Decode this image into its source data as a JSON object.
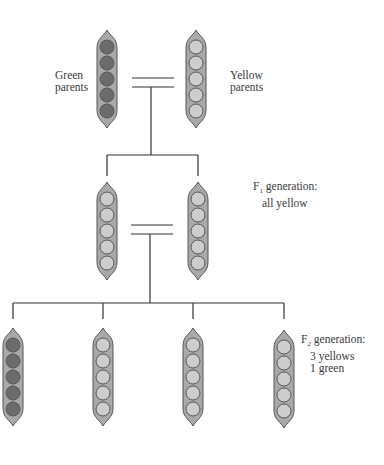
{
  "colors": {
    "pod_fill": "#a9a9a9",
    "pod_stroke": "#555555",
    "green_pea": "#6b6b6b",
    "yellow_pea": "#cdcdcd",
    "line": "#333333"
  },
  "generations": [
    {
      "name": "parents",
      "pods": [
        {
          "id": "green-parent",
          "pea_color": "green",
          "cx": 107,
          "top": 30
        },
        {
          "id": "yellow-parent",
          "pea_color": "yellow",
          "cx": 196,
          "top": 30
        }
      ],
      "labels": [
        {
          "id": "green-parents-label",
          "lines": [
            "Green",
            "parents"
          ],
          "x": 55,
          "y": 69
        },
        {
          "id": "yellow-parents-label",
          "lines": [
            "Yellow",
            "parents"
          ],
          "x": 230,
          "y": 69
        }
      ]
    },
    {
      "name": "F1",
      "pods": [
        {
          "id": "f1-pod-1",
          "pea_color": "yellow",
          "cx": 107,
          "top": 182
        },
        {
          "id": "f1-pod-2",
          "pea_color": "yellow",
          "cx": 198,
          "top": 182
        }
      ],
      "label": {
        "prefix": "F",
        "sub": "1",
        "line1": " generation:",
        "line2": "all yellow",
        "x": 253,
        "y": 180
      }
    },
    {
      "name": "F2",
      "pods": [
        {
          "id": "f2-pod-1",
          "pea_color": "green",
          "cx": 13,
          "top": 328
        },
        {
          "id": "f2-pod-2",
          "pea_color": "yellow",
          "cx": 103,
          "top": 328
        },
        {
          "id": "f2-pod-3",
          "pea_color": "yellow",
          "cx": 193,
          "top": 328
        },
        {
          "id": "f2-pod-4",
          "pea_color": "yellow",
          "cx": 284,
          "top": 330
        }
      ],
      "label": {
        "prefix": "F",
        "sub": "2",
        "line1": " generation:",
        "line2": "3 yellows",
        "line3": "1 green",
        "x": 301,
        "y": 333
      }
    }
  ],
  "crosses": [
    {
      "x1": 132,
      "x2": 174,
      "y1": 78,
      "y2": 87,
      "drop_x": 151,
      "drop_to": 155,
      "bar_x1": 107,
      "bar_x2": 198,
      "bar_y": 155,
      "legs": [
        107,
        198
      ],
      "leg_to": 176
    },
    {
      "x1": 131,
      "x2": 173,
      "y1": 225,
      "y2": 234,
      "drop_x": 150,
      "drop_to": 303,
      "bar_x1": 13,
      "bar_x2": 284,
      "bar_y": 303,
      "legs": [
        13,
        103,
        193,
        284
      ],
      "leg_to": 319
    }
  ]
}
